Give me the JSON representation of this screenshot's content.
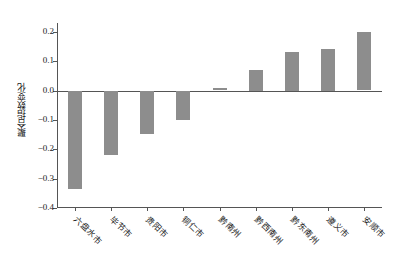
{
  "chart_data": {
    "type": "bar",
    "title": "",
    "xlabel": "",
    "ylabel": "聚合指数变化",
    "categories": [
      "六盘水市",
      "毕节市",
      "贵阳市",
      "铜仁市",
      "黔南州",
      "黔西南州",
      "黔东南州",
      "遵义市",
      "安顺市"
    ],
    "values": [
      -0.335,
      -0.22,
      -0.148,
      -0.1,
      0.01,
      0.07,
      0.132,
      0.143,
      0.199
    ],
    "ylim": [
      -0.4,
      0.23
    ],
    "yticks": [
      0.2,
      0.1,
      0.0,
      -0.1,
      -0.2,
      -0.3,
      -0.4
    ],
    "ytick_labels": [
      "0.2",
      "0.1",
      "0.0",
      "-0.1",
      "-0.2",
      "-0.3",
      "-0.4"
    ],
    "grid": false,
    "legend": null,
    "bar_color": "#8d8d8d",
    "axis_color": "#555555",
    "background": "#ffffff"
  }
}
